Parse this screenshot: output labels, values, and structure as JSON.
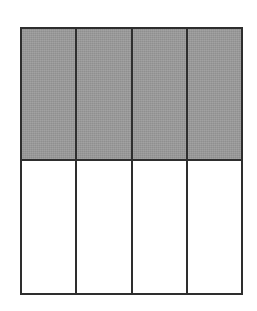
{
  "figure": {
    "kind": "fraction-area-model",
    "background_color": "#ffffff",
    "line_color": "#2e2e2e",
    "line_width_px": 2,
    "shaded_fill_color": "#9a9a9a",
    "unshaded_fill_color": "#ffffff",
    "columns": 4,
    "rows": 2,
    "total_parts": 8,
    "shaded_parts": 4,
    "fraction_label": "4/8",
    "rect": {
      "x": 20,
      "y": 27,
      "width": 223,
      "height": 268
    },
    "vertical_dividers_x": [
      77,
      132,
      187
    ],
    "horizontal_dividers_y": [
      159
    ],
    "rows_data": [
      {
        "name": "top-row-shaded",
        "shaded": true,
        "cells": [
          {
            "name": "cell-r1-c1",
            "state": "shaded"
          },
          {
            "name": "cell-r1-c2",
            "state": "shaded"
          },
          {
            "name": "cell-r1-c3",
            "state": "shaded"
          },
          {
            "name": "cell-r1-c4",
            "state": "shaded"
          }
        ]
      },
      {
        "name": "bottom-row-unshaded",
        "shaded": false,
        "cells": [
          {
            "name": "cell-r2-c1",
            "state": "empty"
          },
          {
            "name": "cell-r2-c2",
            "state": "empty"
          },
          {
            "name": "cell-r2-c3",
            "state": "empty"
          },
          {
            "name": "cell-r2-c4",
            "state": "empty"
          }
        ]
      }
    ]
  }
}
